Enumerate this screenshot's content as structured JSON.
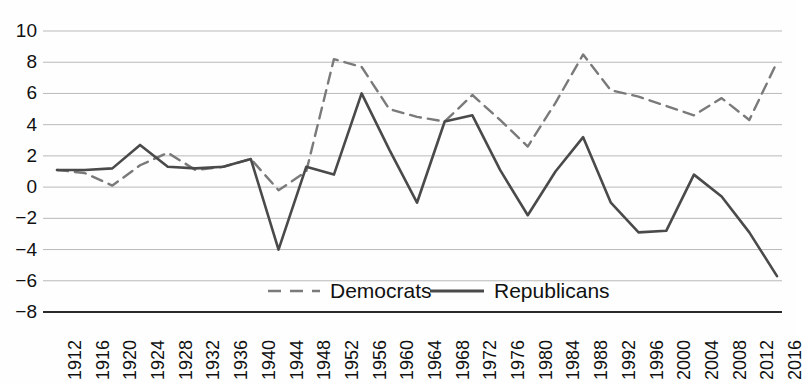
{
  "chart_data": {
    "type": "line",
    "title": "",
    "subtitle": "",
    "xlabel": "",
    "ylabel": "",
    "grid": true,
    "legend_position": "bottom-center",
    "xlim": [
      1912,
      2016
    ],
    "ylim": [
      -8,
      10
    ],
    "ytick_step": 2,
    "yticks": [
      10,
      8,
      6,
      4,
      2,
      0,
      -2,
      -4,
      -6,
      -8
    ],
    "ytick_labels": [
      "10",
      "8",
      "6",
      "4",
      "2",
      "0",
      "−2",
      "−4",
      "−6",
      "−8"
    ],
    "categories": [
      "1912",
      "1916",
      "1920",
      "1924",
      "1928",
      "1932",
      "1936",
      "1940",
      "1944",
      "1948",
      "1952",
      "1956",
      "1960",
      "1964",
      "1968",
      "1972",
      "1976",
      "1980",
      "1984",
      "1988",
      "1992",
      "1996",
      "2000",
      "2004",
      "2008",
      "2012",
      "2016"
    ],
    "x": [
      1912,
      1916,
      1920,
      1924,
      1928,
      1932,
      1936,
      1940,
      1944,
      1948,
      1952,
      1956,
      1960,
      1964,
      1968,
      1972,
      1976,
      1980,
      1984,
      1988,
      1992,
      1996,
      2000,
      2004,
      2008,
      2012,
      2016
    ],
    "series": [
      {
        "name": "Democrats",
        "style": "dashed",
        "color": "#7a7a7a",
        "values": [
          1.1,
          0.9,
          0.1,
          1.4,
          2.2,
          1.1,
          1.3,
          1.8,
          -0.2,
          1.0,
          8.2,
          7.7,
          5.0,
          4.5,
          4.2,
          5.9,
          4.3,
          2.6,
          5.4,
          8.5,
          6.2,
          5.8,
          5.2,
          4.6,
          5.7,
          4.3,
          8.0
        ]
      },
      {
        "name": "Republicans",
        "style": "solid",
        "color": "#4a4a4a",
        "values": [
          1.1,
          1.1,
          1.2,
          2.7,
          1.3,
          1.2,
          1.3,
          1.8,
          -4.0,
          1.3,
          0.8,
          6.0,
          2.4,
          -1.0,
          4.2,
          4.6,
          1.1,
          -1.8,
          1.0,
          3.2,
          -1.0,
          -2.9,
          -2.8,
          0.8,
          -0.6,
          -2.9,
          -5.7
        ]
      }
    ]
  },
  "legend": {
    "items": [
      {
        "label": "Democrats",
        "style": "dashed"
      },
      {
        "label": "Republicans",
        "style": "solid"
      }
    ]
  }
}
